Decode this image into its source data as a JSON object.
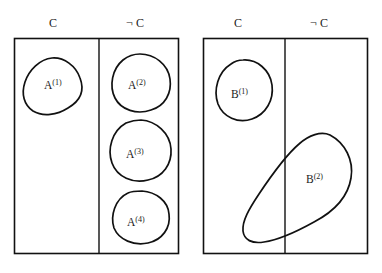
{
  "figure": {
    "type": "venn-partition-diagram",
    "background_color": "#ffffff",
    "stroke_color": "#111111",
    "text_color": "#1a1a1a"
  },
  "panels": [
    {
      "id": "panel-a",
      "name": "panel-a",
      "column_labels": {
        "left": "C",
        "right": "¬ C"
      },
      "regions": [
        {
          "id": "A1",
          "label_base": "A",
          "label_sup": "(1)",
          "column": "C"
        },
        {
          "id": "A2",
          "label_base": "A",
          "label_sup": "(2)",
          "column": "notC"
        },
        {
          "id": "A3",
          "label_base": "A",
          "label_sup": "(3)",
          "column": "notC"
        },
        {
          "id": "A4",
          "label_base": "A",
          "label_sup": "(4)",
          "column": "notC"
        }
      ]
    },
    {
      "id": "panel-b",
      "name": "panel-b",
      "column_labels": {
        "left": "C",
        "right": "¬ C"
      },
      "regions": [
        {
          "id": "B1",
          "label_base": "B",
          "label_sup": "(1)",
          "column": "C"
        },
        {
          "id": "B2",
          "label_base": "B",
          "label_sup": "(2)",
          "column": "both"
        }
      ]
    }
  ],
  "labels": {
    "panel_a_left": "C",
    "panel_a_right": "¬ C",
    "panel_b_left": "C",
    "panel_b_right": "¬ C",
    "A1_base": "A",
    "A1_sup": "(1)",
    "A2_base": "A",
    "A2_sup": "(2)",
    "A3_base": "A",
    "A3_sup": "(3)",
    "A4_base": "A",
    "A4_sup": "(4)",
    "B1_base": "B",
    "B1_sup": "(1)",
    "B2_base": "B",
    "B2_sup": "(2)"
  }
}
